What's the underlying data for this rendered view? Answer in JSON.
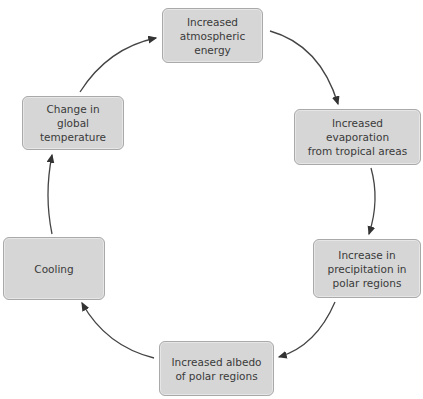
{
  "diagram": {
    "type": "cycle",
    "nodes": [
      {
        "id": "n1",
        "label": "Increased\natmospheric\nenergy"
      },
      {
        "id": "n2",
        "label": "Increased\nevaporation\nfrom tropical areas"
      },
      {
        "id": "n3",
        "label": "Increase in\nprecipitation in\npolar regions"
      },
      {
        "id": "n4",
        "label": "Increased albedo\nof polar regions"
      },
      {
        "id": "n5",
        "label": "Cooling"
      },
      {
        "id": "n6",
        "label": "Change in\nglobal temperature"
      }
    ],
    "edges": [
      {
        "from": "n1",
        "to": "n2"
      },
      {
        "from": "n2",
        "to": "n3"
      },
      {
        "from": "n3",
        "to": "n4"
      },
      {
        "from": "n4",
        "to": "n5"
      },
      {
        "from": "n5",
        "to": "n6"
      },
      {
        "from": "n6",
        "to": "n1"
      }
    ],
    "colors": {
      "box_fill": "#d6d6d6",
      "box_border": "#a9a9a9",
      "arrow": "#333333",
      "text": "#3a3a3a"
    }
  }
}
